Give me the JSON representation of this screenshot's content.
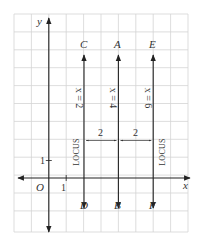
{
  "diagram": {
    "title": "",
    "axes": {
      "x_label": "x",
      "y_label": "y",
      "origin_label": "O",
      "x_unit_label": "1",
      "y_unit_label": "1"
    },
    "lines": [
      {
        "equation": "x = 2",
        "top_point": "C",
        "bottom_point": "D",
        "locus_label": "LOCUS",
        "x": 2
      },
      {
        "equation": "x = 4",
        "top_point": "A",
        "bottom_point": "B",
        "x": 4
      },
      {
        "equation": "x = 6",
        "top_point": "E",
        "bottom_point": "F",
        "locus_label": "LOCUS",
        "x": 6
      }
    ],
    "distances": [
      {
        "label": "2",
        "from": 2,
        "to": 4
      },
      {
        "label": "2",
        "from": 4,
        "to": 6
      }
    ],
    "colors": {
      "grid": "#d4d4d4",
      "lines": "#222222",
      "text": "#333333"
    }
  }
}
